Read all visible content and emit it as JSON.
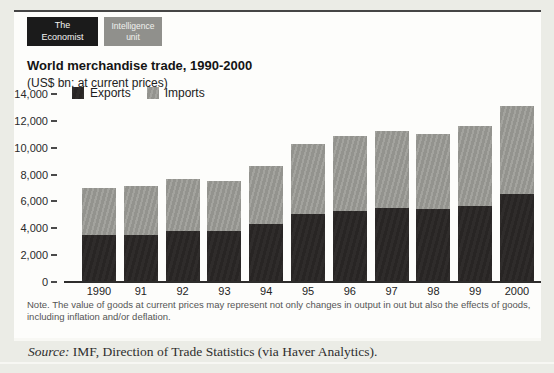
{
  "header": {
    "logo_primary": {
      "line1": "The",
      "line2": "Economist"
    },
    "logo_secondary": {
      "line1": "Intelligence",
      "line2": "unit"
    }
  },
  "chart": {
    "title": "World merchandise trade, 1990-2000",
    "subtitle": "(US$ bn; at current prices)"
  },
  "chart_data": {
    "type": "bar",
    "stacked": true,
    "title": "World merchandise trade, 1990-2000",
    "subtitle": "(US$ bn; at current prices)",
    "unit": "US$ bn",
    "categories": [
      "1990",
      "91",
      "92",
      "93",
      "94",
      "95",
      "96",
      "97",
      "98",
      "99",
      "2000"
    ],
    "series": [
      {
        "name": "Exports",
        "color": "#2c2928",
        "values": [
          3400,
          3450,
          3750,
          3750,
          4250,
          5000,
          5250,
          5450,
          5350,
          5550,
          6450
        ]
      },
      {
        "name": "Imports",
        "color": "#9b9b96",
        "values": [
          3500,
          3650,
          3850,
          3700,
          4300,
          5200,
          5550,
          5750,
          5600,
          6000,
          6600
        ]
      }
    ],
    "totals": [
      6900,
      7100,
      7600,
      7450,
      8550,
      10200,
      10800,
      11200,
      10950,
      11550,
      13050
    ],
    "ylim": [
      0,
      14000
    ],
    "y_ticks": {
      "values": [
        0,
        2000,
        4000,
        6000,
        8000,
        10000,
        12000,
        14000
      ],
      "labels": [
        "0",
        "2,000",
        "4,000",
        "6,000",
        "8,000",
        "10,000",
        "12,000",
        "14,000"
      ]
    },
    "grid": false,
    "legend_position": "top-left-inside"
  },
  "note": "Note. The value of goods at current prices may represent not only changes in output in out but also the effects of goods, including inflation and/or deflation.",
  "source": {
    "prefix": "Source:",
    "text": " IMF, Direction of Trade Statistics (via Haver Analytics)."
  }
}
